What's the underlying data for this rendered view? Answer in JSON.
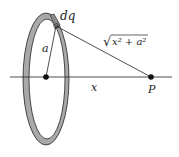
{
  "diagram": {
    "labels": {
      "charge_element": "dq",
      "radius": "a",
      "distance": "x",
      "point": "P",
      "hypotenuse_sqrt": "√",
      "hypotenuse_expr": "x² + a²"
    },
    "colors": {
      "ring_fill": "#a9a9a9",
      "stroke": "#222222",
      "background": "#ffffff"
    }
  }
}
